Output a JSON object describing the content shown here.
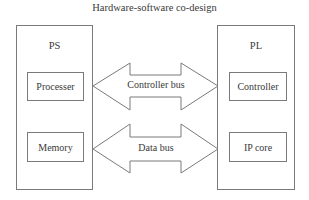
{
  "title": "Hardware-software co-design",
  "ps": {
    "label": "PS",
    "blocks": [
      "Processer",
      "Memory"
    ]
  },
  "pl": {
    "label": "PL",
    "blocks": [
      "Controller",
      "IP core"
    ]
  },
  "buses": [
    {
      "label": "Controller bus",
      "direction": "bidirectional"
    },
    {
      "label": "Data bus",
      "direction": "bidirectional"
    }
  ],
  "colors": {
    "stroke": "#7a7a7a",
    "text": "#3a3a3a",
    "background": "#ffffff"
  }
}
